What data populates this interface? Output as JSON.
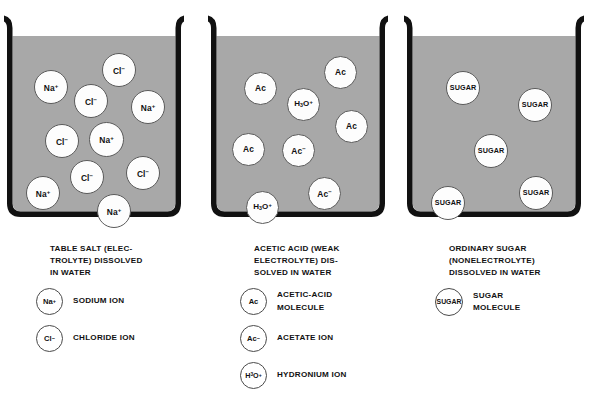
{
  "figure": {
    "background_color": "#ffffff",
    "liquid_color": "#a8a8a8",
    "outline_color": "#111111",
    "molecule_fill": "#fdfdfd"
  },
  "panels": [
    {
      "id": "table-salt",
      "caption_lines": [
        "TABLE SALT (ELEC-",
        "TROLYTE) DISSOLVED",
        "IN WATER"
      ],
      "molecules": [
        {
          "label": "Na+",
          "html": "Na<sup>+</sup>",
          "x": 30,
          "y": 56,
          "d": 34,
          "fs": 8.4
        },
        {
          "label": "Cl-",
          "html": "Cl<sup>&#8722;</sup>",
          "x": 70,
          "y": 70,
          "d": 34,
          "fs": 8.4
        },
        {
          "label": "Cl-",
          "html": "Cl<sup>&#8722;</sup>",
          "x": 98,
          "y": 39,
          "d": 34,
          "fs": 8.4
        },
        {
          "label": "Na+",
          "html": "Na<sup>+</sup>",
          "x": 127,
          "y": 76,
          "d": 34,
          "fs": 8.4
        },
        {
          "label": "Cl-",
          "html": "Cl<sup>&#8722;</sup>",
          "x": 41,
          "y": 110,
          "d": 34,
          "fs": 8.4
        },
        {
          "label": "Na+",
          "html": "Na<sup>+</sup>",
          "x": 85,
          "y": 108,
          "d": 35,
          "fs": 8.4
        },
        {
          "label": "Cl-",
          "html": "Cl<sup>&#8722;</sup>",
          "x": 66,
          "y": 146,
          "d": 34,
          "fs": 8.4
        },
        {
          "label": "Cl-",
          "html": "Cl<sup>&#8722;</sup>",
          "x": 122,
          "y": 142,
          "d": 34,
          "fs": 8.4
        },
        {
          "label": "Na+",
          "html": "Na<sup>+</sup>",
          "x": 22,
          "y": 162,
          "d": 34,
          "fs": 8.4
        },
        {
          "label": "Na+",
          "html": "Na<sup>+</sup>",
          "x": 93,
          "y": 180,
          "d": 34,
          "fs": 8.4
        }
      ],
      "legend": [
        {
          "chip": "Na+",
          "chip_html": "Na<sup>+</sup>",
          "d": 27,
          "fs": 7.6,
          "text": [
            "SODIUM ION"
          ]
        },
        {
          "chip": "Cl-",
          "chip_html": "Cl<sup>&#8722;</sup>",
          "d": 27,
          "fs": 7.6,
          "text": [
            "CHLORIDE ION"
          ]
        }
      ]
    },
    {
      "id": "acetic-acid",
      "caption_lines": [
        "ACETIC ACID (WEAK",
        "ELECTROLYTE) DIS-",
        "SOLVED IN WATER"
      ],
      "molecules": [
        {
          "label": "Ac",
          "html": "Ac",
          "x": 36,
          "y": 58,
          "d": 33,
          "fs": 8.4
        },
        {
          "label": "Ac",
          "html": "Ac",
          "x": 116,
          "y": 42,
          "d": 33,
          "fs": 8.4
        },
        {
          "label": "H3O+",
          "html": "H<sub>3</sub>O<sup>+</sup>",
          "x": 79,
          "y": 74,
          "d": 33,
          "fs": 8.0
        },
        {
          "label": "Ac",
          "html": "Ac",
          "x": 127,
          "y": 96,
          "d": 33,
          "fs": 8.4
        },
        {
          "label": "Ac",
          "html": "Ac",
          "x": 24,
          "y": 119,
          "d": 33,
          "fs": 8.4
        },
        {
          "label": "Ac-",
          "html": "Ac<sup>&#8722;</sup>",
          "x": 74,
          "y": 120,
          "d": 33,
          "fs": 8.4
        },
        {
          "label": "Ac-",
          "html": "Ac<sup>&#8722;</sup>",
          "x": 100,
          "y": 163,
          "d": 33,
          "fs": 8.4
        },
        {
          "label": "H3O+",
          "html": "H<sub>3</sub>O<sup>+</sup>",
          "x": 38,
          "y": 177,
          "d": 33,
          "fs": 8.0
        }
      ],
      "legend": [
        {
          "chip": "Ac",
          "chip_html": "Ac",
          "d": 27,
          "fs": 7.6,
          "text": [
            "ACETIC-ACID",
            "MOLECULE"
          ]
        },
        {
          "chip": "Ac-",
          "chip_html": "Ac<sup>&#8722;</sup>",
          "d": 27,
          "fs": 7.6,
          "text": [
            "ACETATE ION"
          ]
        },
        {
          "chip": "H3O+",
          "chip_html": "H<sub>3</sub>O<sup>+</sup>",
          "d": 27,
          "fs": 7.2,
          "text": [
            "HYDRONIUM ION"
          ]
        }
      ]
    },
    {
      "id": "ordinary-sugar",
      "caption_lines": [
        "ORDINARY SUGAR",
        "(NONELECTROLYTE)",
        "DISSOLVED IN WATER"
      ],
      "molecules": [
        {
          "label": "SUGAR",
          "html": "SUGAR",
          "x": 42,
          "y": 57,
          "d": 34,
          "fs": 7.2
        },
        {
          "label": "SUGAR",
          "html": "SUGAR",
          "x": 114,
          "y": 74,
          "d": 34,
          "fs": 7.2
        },
        {
          "label": "SUGAR",
          "html": "SUGAR",
          "x": 70,
          "y": 120,
          "d": 34,
          "fs": 7.2
        },
        {
          "label": "SUGAR",
          "html": "SUGAR",
          "x": 115,
          "y": 162,
          "d": 34,
          "fs": 7.2
        },
        {
          "label": "SUGAR",
          "html": "SUGAR",
          "x": 27,
          "y": 172,
          "d": 34,
          "fs": 7.2
        }
      ],
      "legend": [
        {
          "chip": "SUGAR",
          "chip_html": "SUGAR",
          "d": 28,
          "fs": 6.9,
          "text": [
            "SUGAR",
            "MOLECULE"
          ]
        }
      ]
    }
  ]
}
